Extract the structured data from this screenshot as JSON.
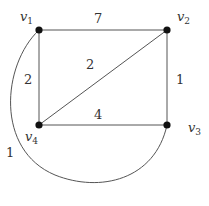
{
  "graph": {
    "vertices": [
      {
        "id": "v1",
        "name": "v",
        "sub": "1",
        "x": 39,
        "y": 30
      },
      {
        "id": "v2",
        "name": "v",
        "sub": "2",
        "x": 167,
        "y": 30
      },
      {
        "id": "v3",
        "name": "v",
        "sub": "3",
        "x": 167,
        "y": 125
      },
      {
        "id": "v4",
        "name": "v",
        "sub": "4",
        "x": 39,
        "y": 125
      }
    ],
    "edges": [
      {
        "from": "v1",
        "to": "v2",
        "weight": "7"
      },
      {
        "from": "v1",
        "to": "v4",
        "weight": "2"
      },
      {
        "from": "v2",
        "to": "v3",
        "weight": "1"
      },
      {
        "from": "v4",
        "to": "v3",
        "weight": "4"
      },
      {
        "from": "v4",
        "to": "v2",
        "weight": "2"
      },
      {
        "from": "v1",
        "to": "v3",
        "weight": "1",
        "shape": "curved"
      }
    ]
  }
}
